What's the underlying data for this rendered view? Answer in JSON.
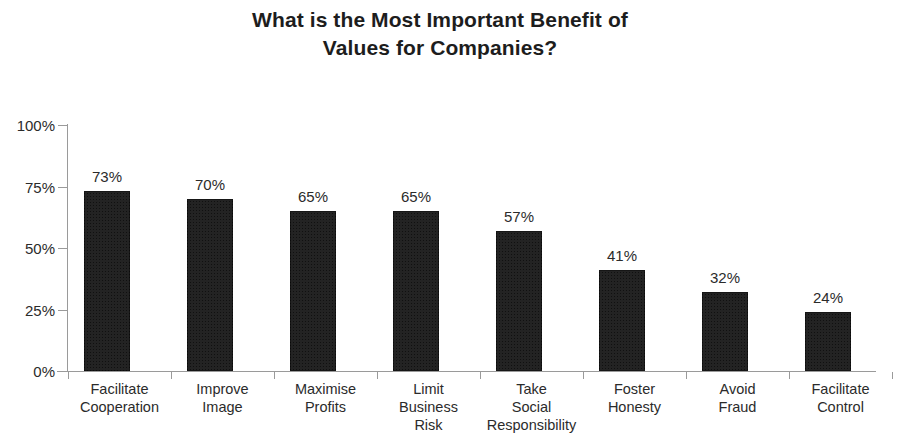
{
  "chart_data": {
    "type": "bar",
    "title": "What is the Most Important Benefit of Values for Companies?",
    "title_lines": [
      "What is the Most Important Benefit of",
      "Values for Companies?"
    ],
    "xlabel": "",
    "ylabel": "",
    "ylim": [
      0,
      100
    ],
    "y_unit": "%",
    "grid": false,
    "legend": null,
    "orientation": "vertical",
    "bar_color": "#232323",
    "background_color": "#ffffff",
    "axis_color": "#9a9a9a",
    "text_color": "#2b2b2b",
    "y_ticks": [
      {
        "value": 100,
        "label": "100%"
      },
      {
        "value": 75,
        "label": "75%"
      },
      {
        "value": 50,
        "label": "50%"
      },
      {
        "value": 25,
        "label": "25%"
      },
      {
        "value": 0,
        "label": "0%"
      }
    ],
    "categories": [
      "Facilitate Cooperation",
      "Improve Image",
      "Maximise Profits",
      "Limit Business Risk",
      "Take Social Responsibility",
      "Foster Honesty",
      "Avoid Fraud",
      "Facilitate Control"
    ],
    "category_label_lines": [
      [
        "Facilitate",
        "Cooperation"
      ],
      [
        "Improve",
        "Image"
      ],
      [
        "Maximise",
        "Profits"
      ],
      [
        "Limit",
        "Business",
        "Risk"
      ],
      [
        "Take",
        "Social",
        "Responsibility"
      ],
      [
        "Foster",
        "Honesty"
      ],
      [
        "Avoid",
        "Fraud"
      ],
      [
        "Facilitate",
        "Control"
      ]
    ],
    "values": [
      73,
      70,
      65,
      65,
      57,
      41,
      32,
      24
    ],
    "value_labels": [
      "73%",
      "70%",
      "65%",
      "65%",
      "57%",
      "41%",
      "32%",
      "24%"
    ]
  }
}
